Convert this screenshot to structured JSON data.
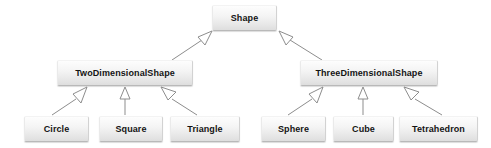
{
  "diagram": {
    "type": "uml-class-inheritance-hierarchy",
    "background_color": "#ffffff",
    "box_fill_top": "#fdfdfd",
    "box_fill_bottom": "#dedede",
    "box_border_color": "#b9b9b9",
    "edge_color": "#8d8d8d",
    "arrowhead_style": "hollow-triangle-generalization",
    "label_color": "#141414",
    "nodes": {
      "shape": {
        "label": "Shape",
        "tier": "root"
      },
      "two_dimensional_shape": {
        "label": "TwoDimensionalShape",
        "tier": "middle"
      },
      "three_dimensional_shape": {
        "label": "ThreeDimensionalShape",
        "tier": "middle"
      },
      "circle": {
        "label": "Circle",
        "tier": "leaf"
      },
      "square": {
        "label": "Square",
        "tier": "leaf"
      },
      "triangle": {
        "label": "Triangle",
        "tier": "leaf"
      },
      "sphere": {
        "label": "Sphere",
        "tier": "leaf"
      },
      "cube": {
        "label": "Cube",
        "tier": "leaf"
      },
      "tetrahedron": {
        "label": "Tetrahedron",
        "tier": "leaf"
      }
    },
    "edges": [
      {
        "from": "TwoDimensionalShape",
        "to": "Shape",
        "relation": "generalization"
      },
      {
        "from": "ThreeDimensionalShape",
        "to": "Shape",
        "relation": "generalization"
      },
      {
        "from": "Circle",
        "to": "TwoDimensionalShape",
        "relation": "generalization"
      },
      {
        "from": "Square",
        "to": "TwoDimensionalShape",
        "relation": "generalization"
      },
      {
        "from": "Triangle",
        "to": "TwoDimensionalShape",
        "relation": "generalization"
      },
      {
        "from": "Sphere",
        "to": "ThreeDimensionalShape",
        "relation": "generalization"
      },
      {
        "from": "Cube",
        "to": "ThreeDimensionalShape",
        "relation": "generalization"
      },
      {
        "from": "Tetrahedron",
        "to": "ThreeDimensionalShape",
        "relation": "generalization"
      }
    ]
  }
}
